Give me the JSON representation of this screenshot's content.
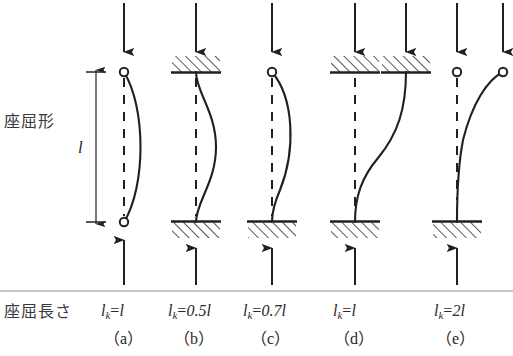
{
  "figure": {
    "kind": "engineering-diagram",
    "canvas": {
      "width": 513,
      "height": 356
    },
    "ink_color": "#231f20",
    "hatch_color": "#3a3a3c",
    "background": "#ffffff"
  },
  "row_labels": {
    "buckling_shape": "座屈形",
    "buckling_length": "座屈長さ"
  },
  "dimension": {
    "label": "l",
    "from_y": 72,
    "to_y": 222
  },
  "columns": [
    {
      "id": "a",
      "case_label": "（a）",
      "lk_prefix": "l",
      "lk_sub": "k",
      "lk_eq": "=",
      "lk_value": "l",
      "lk_text": "lk=l",
      "top_support": "pin",
      "bottom_support": "pin",
      "top_sway": false,
      "mode": "single-bow",
      "top_arrows": 1,
      "bottom_arrows": 1,
      "axis_x": 124
    },
    {
      "id": "b",
      "case_label": "（b）",
      "lk_prefix": "l",
      "lk_sub": "k",
      "lk_eq": "=",
      "lk_value": "0.5l",
      "lk_text": "lk=0.5l",
      "top_support": "fixed",
      "bottom_support": "fixed",
      "top_sway": false,
      "mode": "double-curvature-S",
      "top_arrows": 1,
      "bottom_arrows": 1,
      "axis_x": 196
    },
    {
      "id": "c",
      "case_label": "（c）",
      "lk_prefix": "l",
      "lk_sub": "k",
      "lk_eq": "=",
      "lk_value": "0.7l",
      "lk_text": "lk=0.7l",
      "top_support": "pin",
      "bottom_support": "fixed",
      "top_sway": false,
      "mode": "pin-fixed-bow",
      "top_arrows": 1,
      "bottom_arrows": 1,
      "axis_x": 272
    },
    {
      "id": "d",
      "case_label": "（d）",
      "lk_prefix": "l",
      "lk_sub": "k",
      "lk_eq": "=",
      "lk_value": "l",
      "lk_text": "lk=l",
      "top_support": "fixed",
      "bottom_support": "fixed",
      "top_sway": true,
      "mode": "fixed-fixed-sway",
      "top_arrows": 2,
      "bottom_arrows": 1,
      "axis_x": 355
    },
    {
      "id": "e",
      "case_label": "（e）",
      "lk_prefix": "l",
      "lk_sub": "k",
      "lk_eq": "=",
      "lk_value": "2l",
      "lk_text": "lk=2l",
      "top_support": "free-pin",
      "bottom_support": "fixed",
      "top_sway": true,
      "mode": "cantilever",
      "top_arrows": 2,
      "bottom_arrows": 1,
      "axis_x": 457
    }
  ]
}
